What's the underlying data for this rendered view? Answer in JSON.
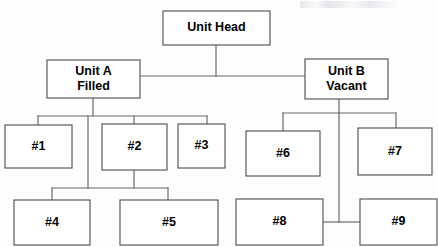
{
  "diagram": {
    "type": "org-chart",
    "title": "",
    "canvas": {
      "width": 438,
      "height": 247
    },
    "style": {
      "box_fill": "#ffffff",
      "box_stroke": "#5a5a5a",
      "connector_stroke": "#6a6a6a",
      "text_color": "#000000",
      "background": "#fdfdfd"
    },
    "nodes": [
      {
        "id": "unit-head",
        "lines": [
          "Unit Head"
        ],
        "x": 163,
        "y": 11,
        "w": 107,
        "h": 34,
        "level": 0
      },
      {
        "id": "unit-a",
        "lines": [
          "Unit A",
          "Filled"
        ],
        "x": 47,
        "y": 60,
        "w": 93,
        "h": 38,
        "level": 1
      },
      {
        "id": "unit-b",
        "lines": [
          "Unit B",
          "Vacant"
        ],
        "x": 305,
        "y": 59,
        "w": 83,
        "h": 40,
        "level": 1
      },
      {
        "id": "pos-1",
        "lines": [
          "#1"
        ],
        "x": 5,
        "y": 125,
        "w": 67,
        "h": 43,
        "level": 2
      },
      {
        "id": "pos-2",
        "lines": [
          "#2"
        ],
        "x": 102,
        "y": 124,
        "w": 65,
        "h": 46,
        "level": 2
      },
      {
        "id": "pos-3",
        "lines": [
          "#3"
        ],
        "x": 178,
        "y": 124,
        "w": 47,
        "h": 44,
        "level": 2
      },
      {
        "id": "pos-6",
        "lines": [
          "#6"
        ],
        "x": 246,
        "y": 131,
        "w": 74,
        "h": 45,
        "level": 2
      },
      {
        "id": "pos-7",
        "lines": [
          "#7"
        ],
        "x": 358,
        "y": 128,
        "w": 74,
        "h": 47,
        "level": 2
      },
      {
        "id": "pos-4",
        "lines": [
          "#4"
        ],
        "x": 14,
        "y": 200,
        "w": 76,
        "h": 45,
        "level": 3
      },
      {
        "id": "pos-5",
        "lines": [
          "#5"
        ],
        "x": 120,
        "y": 200,
        "w": 98,
        "h": 45,
        "level": 3
      },
      {
        "id": "pos-8",
        "lines": [
          "#8"
        ],
        "x": 236,
        "y": 199,
        "w": 87,
        "h": 46,
        "level": 3
      },
      {
        "id": "pos-9",
        "lines": [
          "#9"
        ],
        "x": 360,
        "y": 199,
        "w": 77,
        "h": 46,
        "level": 3
      }
    ],
    "connectors": [
      {
        "id": "head-stem-down",
        "points": "216,45 216,76"
      },
      {
        "id": "head-bus-horizontal",
        "points": "93,76 345,76"
      },
      {
        "id": "unit-a-stem-down",
        "points": "93,98 93,116"
      },
      {
        "id": "unit-a-bus",
        "points": "38,116 207,116"
      },
      {
        "id": "branch-to-1",
        "points": "38,116 38,125"
      },
      {
        "id": "branch-to-2",
        "points": "134,116 134,124"
      },
      {
        "id": "branch-to-3",
        "points": "207,116 207,124"
      },
      {
        "id": "spine-left-down",
        "points": "88,116 88,188"
      },
      {
        "id": "pos2-stem-down",
        "points": "134,170 134,188"
      },
      {
        "id": "lower-left-bus",
        "points": "52,188 168,188"
      },
      {
        "id": "branch-to-4",
        "points": "52,188 52,200"
      },
      {
        "id": "branch-to-5",
        "points": "168,188 168,200"
      },
      {
        "id": "unit-b-stem-down",
        "points": "339,99 339,113"
      },
      {
        "id": "unit-b-bus",
        "points": "283,113 396,113"
      },
      {
        "id": "branch-to-6",
        "points": "283,113 283,131"
      },
      {
        "id": "branch-to-7",
        "points": "396,113 396,128"
      },
      {
        "id": "spine-right-down",
        "points": "339,113 339,222"
      },
      {
        "id": "link-to-8",
        "points": "323,222 339,222"
      },
      {
        "id": "link-to-9",
        "points": "339,222 360,222"
      }
    ]
  }
}
